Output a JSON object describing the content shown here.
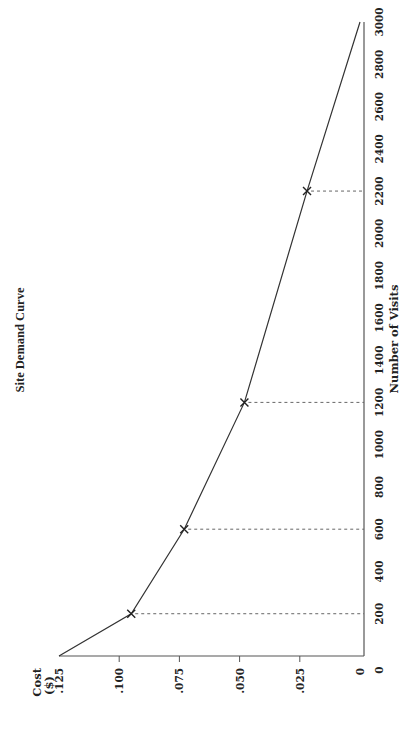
{
  "chart_data": {
    "type": "line",
    "title": "Site Demand Curve",
    "xlabel": "Number of Visits",
    "ylabel": "Cost ($)",
    "ylabel_lines": [
      "Cost",
      "($)"
    ],
    "orientation_note": "figure rotated 90 degrees counter-clockwise",
    "x_ticks": [
      200,
      400,
      600,
      800,
      1000,
      1200,
      1400,
      1600,
      1800,
      2000,
      2200,
      2400,
      2600,
      2800,
      3000
    ],
    "x_zero_label": "0",
    "y_ticks": [
      ".125",
      ".100",
      ".075",
      ".050",
      ".025",
      "0"
    ],
    "y_tick_values": [
      0.125,
      0.1,
      0.075,
      0.05,
      0.025,
      0
    ],
    "xlim": [
      0,
      3000
    ],
    "ylim": [
      0,
      0.125
    ],
    "grid": false,
    "series": [
      {
        "name": "Demand",
        "x": [
          0,
          200,
          600,
          1200,
          2200,
          3000
        ],
        "y": [
          0.125,
          0.095,
          0.073,
          0.048,
          0.022,
          0
        ]
      }
    ],
    "marked_points": [
      {
        "visits": 200,
        "cost": 0.095
      },
      {
        "visits": 600,
        "cost": 0.073
      },
      {
        "visits": 1200,
        "cost": 0.048
      },
      {
        "visits": 2200,
        "cost": 0.022
      }
    ],
    "annotations": "dashed drop lines from marked points to the Number of Visits axis"
  },
  "colors": {
    "line": "#333333",
    "axis": "#555555",
    "dashed": "#666666",
    "background": "#ffffff"
  }
}
